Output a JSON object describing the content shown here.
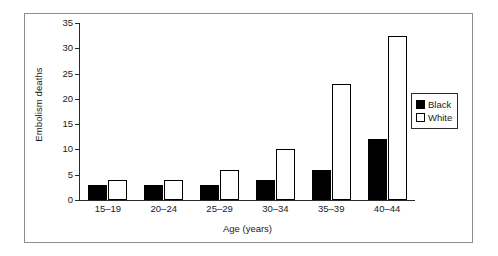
{
  "chart_data": {
    "type": "bar",
    "title": "",
    "xlabel": "Age (years)",
    "ylabel": "Embolism deaths",
    "categories": [
      "15–19",
      "20–24",
      "25–29",
      "30–34",
      "35–39",
      "40–44"
    ],
    "series": [
      {
        "name": "Black",
        "color": "#000000",
        "values": [
          3,
          3,
          3,
          4,
          6,
          12
        ]
      },
      {
        "name": "White",
        "color": "#ffffff",
        "values": [
          4,
          4,
          6,
          10,
          23,
          32.5
        ]
      }
    ],
    "ylim": [
      0,
      35
    ],
    "ytick_values": [
      35,
      30,
      25,
      20,
      15,
      10,
      5,
      0
    ],
    "ytick_labels": [
      "35",
      "30",
      "25",
      "20",
      "15",
      "10",
      "5",
      "0"
    ],
    "grid": false,
    "legend_position": "right"
  },
  "legend": {
    "items": [
      {
        "label": "Black",
        "swatch": "filled-square-icon"
      },
      {
        "label": "White",
        "swatch": "hollow-square-icon"
      }
    ]
  }
}
